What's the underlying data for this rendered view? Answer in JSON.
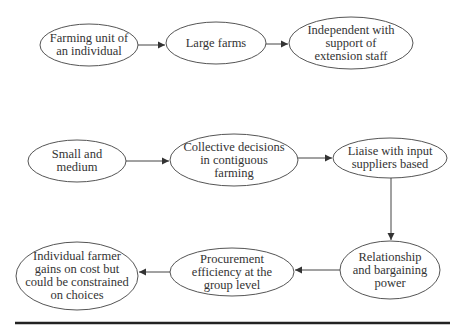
{
  "diagram": {
    "type": "flowchart",
    "colors": {
      "stroke": "#444444",
      "text": "#333333",
      "rule": "#222222"
    },
    "rows": [
      {
        "name": "large-farms-path",
        "nodes": [
          {
            "id": "n1",
            "lines": [
              "Farming unit of",
              "an individual"
            ]
          },
          {
            "id": "n2",
            "lines": [
              "Large farms"
            ]
          },
          {
            "id": "n3",
            "lines": [
              "Independent with",
              "support of",
              "extension staff"
            ]
          }
        ]
      },
      {
        "name": "small-medium-path",
        "nodes": [
          {
            "id": "n4",
            "lines": [
              "Small and",
              "medium"
            ]
          },
          {
            "id": "n5",
            "lines": [
              "Collective decisions",
              "in contiguous",
              "farming"
            ]
          },
          {
            "id": "n6",
            "lines": [
              "Liaise with input",
              "suppliers based"
            ]
          },
          {
            "id": "n7",
            "lines": [
              "Relationship",
              "and bargaining",
              "power"
            ]
          },
          {
            "id": "n8",
            "lines": [
              "Procurement",
              "efficiency at the",
              "group level"
            ]
          },
          {
            "id": "n9",
            "lines": [
              "Individual farmer",
              "gains on cost but",
              "could be constrained",
              "on choices"
            ]
          }
        ]
      }
    ],
    "edges": [
      {
        "from": "n1",
        "to": "n2"
      },
      {
        "from": "n2",
        "to": "n3"
      },
      {
        "from": "n4",
        "to": "n5"
      },
      {
        "from": "n5",
        "to": "n6"
      },
      {
        "from": "n6",
        "to": "n7"
      },
      {
        "from": "n7",
        "to": "n8"
      },
      {
        "from": "n8",
        "to": "n9"
      }
    ]
  }
}
